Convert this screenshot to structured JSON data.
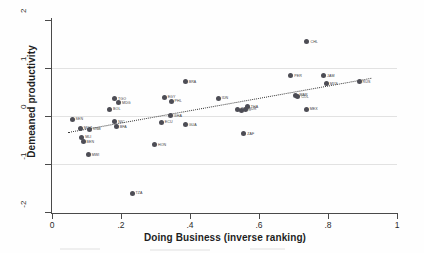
{
  "chart_data": {
    "type": "scatter",
    "title": "",
    "xlabel": "Doing Business (inverse ranking)",
    "ylabel": "Demeaned productivity",
    "xlim": [
      0,
      1
    ],
    "ylim": [
      -2,
      2
    ],
    "xticks": [
      "0",
      ".2",
      ".4",
      ".6",
      ".8",
      "1"
    ],
    "xtick_values": [
      0,
      0.2,
      0.4,
      0.6,
      0.8,
      1
    ],
    "yticks": [
      "2",
      "1",
      "0",
      "-1",
      "-2"
    ],
    "ytick_values": [
      2,
      1,
      0,
      -1,
      -2
    ],
    "grid": "horizontal gridlines at y = 1, 0, -1",
    "legend": "none",
    "marker_color": "#4d4d55",
    "fit_line": {
      "style": "dotted",
      "color": "#3a3a3a",
      "x0": 0.045,
      "y0": -0.34,
      "x1": 0.925,
      "y1": 0.79
    },
    "points": [
      {
        "label": "SEN",
        "x": 0.058,
        "y": -0.07
      },
      {
        "label": "MOZ",
        "x": 0.082,
        "y": -0.25
      },
      {
        "label": "MLI",
        "x": 0.086,
        "y": -0.44
      },
      {
        "label": "BEN",
        "x": 0.09,
        "y": -0.54
      },
      {
        "label": "GNB",
        "x": 0.108,
        "y": -0.28
      },
      {
        "label": "MWI",
        "x": 0.105,
        "y": -0.81
      },
      {
        "label": "BOL",
        "x": 0.167,
        "y": 0.14
      },
      {
        "label": "TGO",
        "x": 0.181,
        "y": 0.36
      },
      {
        "label": "MDG",
        "x": 0.193,
        "y": 0.28
      },
      {
        "label": "NIC",
        "x": 0.182,
        "y": -0.12
      },
      {
        "label": "BFA",
        "x": 0.186,
        "y": -0.22
      },
      {
        "label": "TZA",
        "x": 0.232,
        "y": -1.61
      },
      {
        "label": "HON",
        "x": 0.297,
        "y": -0.6
      },
      {
        "label": "ECU",
        "x": 0.317,
        "y": -0.13
      },
      {
        "label": "EGY",
        "x": 0.325,
        "y": 0.39
      },
      {
        "label": "PHL",
        "x": 0.345,
        "y": 0.31
      },
      {
        "label": "GHA",
        "x": 0.343,
        "y": 0.01
      },
      {
        "label": "BRA",
        "x": 0.386,
        "y": 0.71
      },
      {
        "label": "GUA",
        "x": 0.386,
        "y": -0.18
      },
      {
        "label": "IDN",
        "x": 0.482,
        "y": 0.37
      },
      {
        "label": "IND",
        "x": 0.537,
        "y": 0.14
      },
      {
        "label": "CRI",
        "x": 0.548,
        "y": 0.12
      },
      {
        "label": "ZAF",
        "x": 0.556,
        "y": -0.37
      },
      {
        "label": "THA",
        "x": 0.566,
        "y": 0.19
      },
      {
        "label": "TUR",
        "x": 0.56,
        "y": 0.14
      },
      {
        "label": "PER",
        "x": 0.692,
        "y": 0.84
      },
      {
        "label": "MAR",
        "x": 0.707,
        "y": 0.43
      },
      {
        "label": "COL",
        "x": 0.712,
        "y": 0.4
      },
      {
        "label": "CHL",
        "x": 0.739,
        "y": 1.55
      },
      {
        "label": "MEX",
        "x": 0.737,
        "y": 0.14
      },
      {
        "label": "JAM",
        "x": 0.787,
        "y": 0.84
      },
      {
        "label": "MYS",
        "x": 0.795,
        "y": 0.67
      },
      {
        "label": "RUS",
        "x": 0.89,
        "y": 0.71
      }
    ]
  },
  "axes": {
    "x_title": "Doing Business (inverse ranking)",
    "y_title": "Demeaned productivity"
  }
}
